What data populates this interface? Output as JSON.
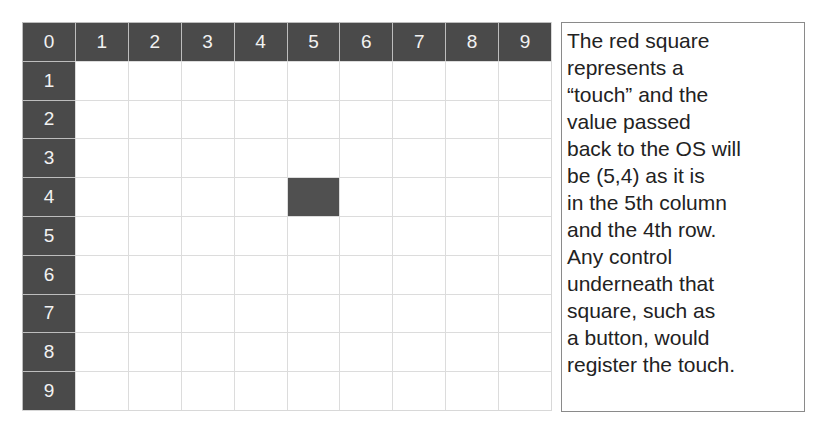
{
  "grid": {
    "columns": [
      "0",
      "1",
      "2",
      "3",
      "4",
      "5",
      "6",
      "7",
      "8",
      "9"
    ],
    "rows": [
      "1",
      "2",
      "3",
      "4",
      "5",
      "6",
      "7",
      "8",
      "9"
    ],
    "touch": {
      "column": 5,
      "row": 4
    },
    "header_color": "#4a4a4a",
    "touch_color": "#505050"
  },
  "caption": {
    "lines": [
      "The red square",
      "represents a",
      "“touch” and the",
      "value passed",
      "back to the OS will",
      "be (5,4) as it is",
      "in the 5th column",
      "and the 4th row.",
      "Any control",
      "underneath that",
      "square, such as",
      "a button, would",
      "register the touch."
    ]
  }
}
